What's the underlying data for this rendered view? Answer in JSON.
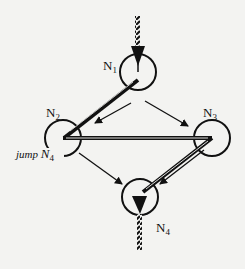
{
  "diagram": {
    "type": "control-flow-graph",
    "nodes": [
      {
        "id": "N1",
        "label": "N",
        "sub": "1"
      },
      {
        "id": "N2",
        "label": "N",
        "sub": "2",
        "annotation": {
          "prefix": "jump ",
          "label": "N",
          "sub": "4"
        }
      },
      {
        "id": "N3",
        "label": "N",
        "sub": "3"
      },
      {
        "id": "N4",
        "label": "N",
        "sub": "4"
      }
    ],
    "edges": [
      {
        "from": "entry",
        "to": "N1",
        "style": "hatched-entry"
      },
      {
        "from": "N1",
        "to": "N2",
        "style": "thin-arrow"
      },
      {
        "from": "N1",
        "to": "N3",
        "style": "thin-arrow"
      },
      {
        "from": "N2",
        "to": "N4",
        "style": "thin-arrow"
      },
      {
        "from": "N3",
        "to": "N4",
        "style": "thin-arrow"
      },
      {
        "from": "N4",
        "to": "exit",
        "style": "hatched-exit"
      }
    ],
    "trace": [
      {
        "from": "N1",
        "to": "N2",
        "style": "thick-path"
      },
      {
        "from": "N2",
        "to": "N3",
        "style": "double-path"
      },
      {
        "from": "N3",
        "to": "N4",
        "style": "double-path"
      }
    ],
    "colors": {
      "ink": "#111111",
      "background": "#f3f3f1"
    }
  }
}
